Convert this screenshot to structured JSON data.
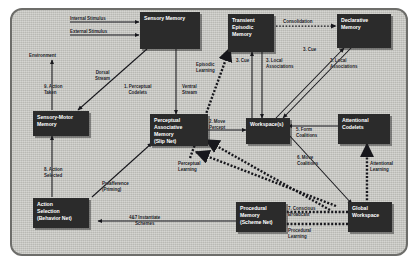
{
  "diagram": {
    "background_color": "#c9c9c4",
    "node_color": "#2b2b2b",
    "node_text_color": "#ffffff",
    "edge_color": "#17171c"
  },
  "nodes": [
    {
      "id": "sensory_memory",
      "label": "Sensory Memory"
    },
    {
      "id": "transient_episodic",
      "label": "Transient\nEpisodic\nMemory"
    },
    {
      "id": "declarative",
      "label": "Declarative\nMemory"
    },
    {
      "id": "sensory_motor",
      "label": "Sensory-Motor\nMemory"
    },
    {
      "id": "perceptual_assoc",
      "label": "Perceptual\nAssociative\nMemory\n(Slip Net)"
    },
    {
      "id": "workspace",
      "label": "Workspace(s)"
    },
    {
      "id": "attentional",
      "label": "Attentional\nCodelets"
    },
    {
      "id": "action_selection",
      "label": "Action\nSelection\n(Behavior Net)"
    },
    {
      "id": "procedural",
      "label": "Procedural\nMemory\n(Scheme Net)"
    },
    {
      "id": "global_workspace",
      "label": "Global\nWorkspace"
    }
  ],
  "node_labels": {
    "sensory_memory": "Sensory Memory",
    "transient_episodic_l1": "Transient",
    "transient_episodic_l2": "Episodic",
    "transient_episodic_l3": "Memory",
    "declarative_l1": "Declarative",
    "declarative_l2": "Memory",
    "sensory_motor_l1": "Sensory-Motor",
    "sensory_motor_l2": "Memory",
    "perceptual_assoc_l1": "Perceptual",
    "perceptual_assoc_l2": "Associative",
    "perceptual_assoc_l3": "Memory",
    "perceptual_assoc_l4": "(Slip Net)",
    "workspace": "Workspace(s)",
    "attentional_l1": "Attentional",
    "attentional_l2": "Codelets",
    "action_selection_l1": "Action",
    "action_selection_l2": "Selection",
    "action_selection_l3": "(Behavior Net)",
    "procedural_l1": "Procedural",
    "procedural_l2": "Memory",
    "procedural_l3": "(Scheme Net)",
    "global_workspace_l1": "Global",
    "global_workspace_l2": "Workspace"
  },
  "edge_labels": {
    "internal_stimulus": "Internal Stimulus",
    "external_stimulus": "External Stimulus",
    "environment": "Environment",
    "consolidation": "Consolidation",
    "dorsal_stream": "Dorsal\nStream",
    "ventral_stream": "Ventral\nStream",
    "perceptual_codelets": "1. Perceptual\nCodelets",
    "episodic_learning": "Episodic\nLearning",
    "cue_transient": "3. Cue",
    "local_assoc_transient": "3. Local\nAssociations",
    "cue_declarative": "3. Cue",
    "local_assoc_declarative": "3. Local\nAssociations",
    "move_percept": "2. Move\nPercept",
    "perceptual_learning": "Perceptual\nLearning",
    "form_coalitions": "5. Form\nCoalitions",
    "move_coalitions": "6. Move\nCoalitions",
    "attentional_learning": "Attentional\nLearning",
    "action_taken": "9. Action\nTaken",
    "action_selected": "8. Action\nSelected",
    "preafference": "Preafference\n(Priming)",
    "instantiate_schemes": "4&7 Instantiate\nSchemes",
    "conscious_broadcast": "7. Conscious\nBroadcast",
    "procedural_learning": "Procedural\nLearning"
  }
}
